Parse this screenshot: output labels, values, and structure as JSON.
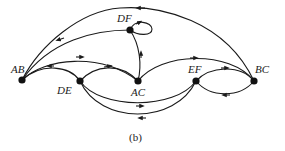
{
  "figure": {
    "caption": "(b)"
  },
  "nodes": [
    {
      "id": "AB",
      "label": "AB",
      "x": 22,
      "y": 80
    },
    {
      "id": "DE",
      "label": "DE",
      "x": 80,
      "y": 81
    },
    {
      "id": "DF",
      "label": "DF",
      "x": 130,
      "y": 30
    },
    {
      "id": "AC",
      "label": "AC",
      "x": 138,
      "y": 81
    },
    {
      "id": "EF",
      "label": "EF",
      "x": 196,
      "y": 81
    },
    {
      "id": "BC",
      "label": "BC",
      "x": 254,
      "y": 81
    }
  ],
  "edges": [
    {
      "from": "BC",
      "to": "AB"
    },
    {
      "from": "DF",
      "to": "AB"
    },
    {
      "from": "DF",
      "to": "DF"
    },
    {
      "from": "AC",
      "to": "DF"
    },
    {
      "from": "AB",
      "to": "AC"
    },
    {
      "from": "DE",
      "to": "AB"
    },
    {
      "from": "DE",
      "to": "AC"
    },
    {
      "from": "AC",
      "to": "BC"
    },
    {
      "from": "EF",
      "to": "BC"
    },
    {
      "from": "BC",
      "to": "EF"
    },
    {
      "from": "DE",
      "to": "EF"
    },
    {
      "from": "EF",
      "to": "DE"
    }
  ],
  "colors": {
    "stroke": "#1a1a1a",
    "node": "#111111",
    "background": "#ffffff"
  }
}
